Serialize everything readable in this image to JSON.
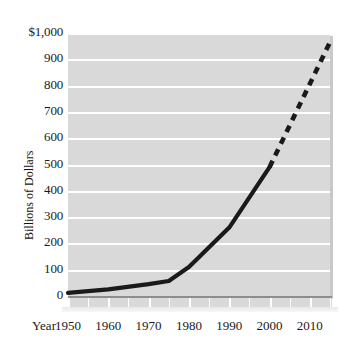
{
  "chart_data": {
    "type": "line",
    "title": "",
    "xlabel": "Year",
    "ylabel": "Billions of Dollars",
    "xlim": [
      1950,
      2015
    ],
    "ylim": [
      0,
      1000
    ],
    "grid": true,
    "legend": false,
    "x_tick_labels": [
      "1950",
      "1960",
      "1970",
      "1980",
      "1990",
      "2000",
      "2010"
    ],
    "x_tick_values": [
      1950,
      1960,
      1970,
      1980,
      1990,
      2000,
      2010
    ],
    "x_minor_ticks": [
      1955,
      1965,
      1975,
      1985,
      1995,
      2005,
      2015
    ],
    "y_tick_labels": [
      "0",
      "100",
      "200",
      "300",
      "400",
      "500",
      "600",
      "700",
      "800",
      "900",
      "$1,000"
    ],
    "y_tick_values": [
      0,
      100,
      200,
      300,
      400,
      500,
      600,
      700,
      800,
      900,
      1000
    ],
    "series": [
      {
        "name": "actual",
        "style": "solid",
        "color": "#1a1a1a",
        "x": [
          1950,
          1960,
          1970,
          1975,
          1980,
          1990,
          2000
        ],
        "values": [
          12,
          25,
          45,
          57,
          110,
          260,
          490
        ]
      },
      {
        "name": "projected",
        "style": "dashed",
        "color": "#1a1a1a",
        "x": [
          2000,
          2015
        ],
        "values": [
          490,
          965
        ]
      }
    ],
    "colors": {
      "plot_background": "#d9d9d9",
      "gridline": "#ffffff",
      "line": "#1a1a1a",
      "axis": "#8d8d8d",
      "page_background": "#ffffff"
    }
  }
}
